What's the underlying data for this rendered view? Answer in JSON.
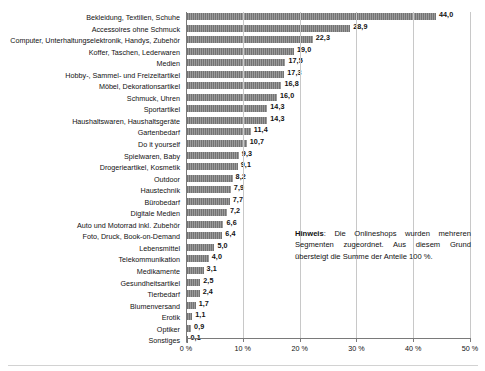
{
  "chart_data": {
    "type": "bar",
    "orientation": "horizontal",
    "title": "",
    "xlabel": "",
    "ylabel": "",
    "xlim": [
      0,
      50
    ],
    "xticks": [
      0,
      10,
      20,
      30,
      40,
      50
    ],
    "xtick_labels": [
      "0 %",
      "10 %",
      "20 %",
      "30 %",
      "40 %",
      "50 %"
    ],
    "grid": true,
    "legend": false,
    "value_format": "comma-decimal",
    "bar_color": "#808080",
    "categories": [
      "Bekleidung, Textilien, Schuhe",
      "Accessoires ohne Schmuck",
      "Computer, Unterhaltungselektronik, Handys, Zubehör",
      "Koffer, Taschen, Lederwaren",
      "Medien",
      "Hobby-, Sammel- und Freizeitartikel",
      "Möbel, Dekorationsartikel",
      "Schmuck, Uhren",
      "Sportartikel",
      "Haushaltswaren, Haushaltsgeräte",
      "Gartenbedarf",
      "Do it yourself",
      "Spielwaren, Baby",
      "Drogerieartikel, Kosmetik",
      "Outdoor",
      "Haustechnik",
      "Bürobedarf",
      "Digitale Medien",
      "Auto und Motorrad inkl. Zubehör",
      "Foto, Druck, Book-on-Demand",
      "Lebensmittel",
      "Telekommunikation",
      "Medikamente",
      "Gesundheitsartikel",
      "Tierbedarf",
      "Blumenversand",
      "Erotik",
      "Optiker",
      "Sonstiges"
    ],
    "values": [
      44.0,
      28.9,
      22.3,
      19.0,
      17.5,
      17.3,
      16.8,
      16.0,
      14.3,
      14.3,
      11.4,
      10.7,
      9.3,
      9.1,
      8.2,
      7.9,
      7.7,
      7.2,
      6.6,
      6.4,
      5.0,
      4.0,
      3.1,
      2.5,
      2.4,
      1.7,
      1.1,
      0.9,
      0.1
    ],
    "value_labels": [
      "44,0",
      "28,9",
      "22,3",
      "19,0",
      "17,5",
      "17,3",
      "16,8",
      "16,0",
      "14,3",
      "14,3",
      "11,4",
      "10,7",
      "9,3",
      "9,1",
      "8,2",
      "7,9",
      "7,7",
      "7,2",
      "6,6",
      "6,4",
      "5,0",
      "4,0",
      "3,1",
      "2,5",
      "2,4",
      "1,7",
      "1,1",
      "0,9",
      "0,1"
    ],
    "annotations": [
      {
        "name": "hinweis-note",
        "label": "Hinweis",
        "separator": ":",
        "text": "Die Onlineshops wurden mehreren Segmenten zugeordnet. Aus diesem Grund übersteigt die Summe der Anteile 100 %."
      }
    ]
  }
}
